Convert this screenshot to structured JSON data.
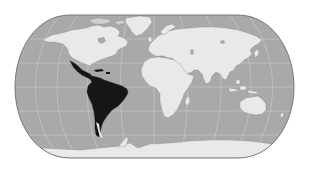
{
  "map": {
    "projection": "world-pseudocylindrical",
    "highlighted_region": "Latin America",
    "colors": {
      "background": "#ffffff",
      "ocean": "#a9a9a9",
      "land": "#e9e9e9",
      "highlight": "#161616",
      "graticule": "#d6d6d6",
      "outline": "#6e6e6e",
      "coast": "#8a8a8a"
    },
    "regions": [
      {
        "name": "North America",
        "highlighted": false
      },
      {
        "name": "Greenland",
        "highlighted": false
      },
      {
        "name": "Latin America",
        "highlighted": true
      },
      {
        "name": "Europe",
        "highlighted": false
      },
      {
        "name": "Africa",
        "highlighted": false
      },
      {
        "name": "Asia",
        "highlighted": false
      },
      {
        "name": "Australia",
        "highlighted": false
      },
      {
        "name": "Antarctica",
        "highlighted": false
      }
    ]
  }
}
